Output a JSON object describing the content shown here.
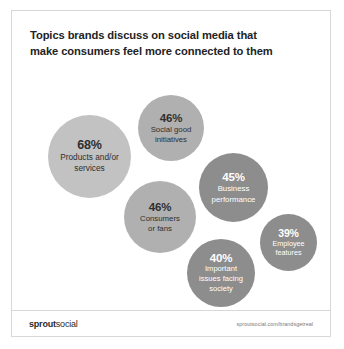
{
  "card": {
    "title_lines": [
      "Topics brands discuss on social media that",
      "make consumers feel more connected to them"
    ]
  },
  "footer": {
    "logo_strong": "sprout",
    "logo_light": "social",
    "url": "sproutsocial.com/brandsgetreal"
  },
  "colors": {
    "bubble_light": "#c2c2c2",
    "bubble_mid": "#b0b0b0",
    "bubble_dark": "#8d8d8d",
    "text_dark": "#2f2f2f",
    "text_light": "#ffffff",
    "title": "#232323",
    "border": "#d8d8d8"
  },
  "chart_data": {
    "type": "bubble",
    "title": "Topics brands discuss on social media that make consumers feel more connected to them",
    "xlabel": "",
    "ylabel": "",
    "value_unit": "percent",
    "legend": "none",
    "grid": false,
    "categories": [
      "Products and/or services",
      "Social good initiatives",
      "Business performance",
      "Consumers or fans",
      "Important issues facing society",
      "Employee features"
    ],
    "values": [
      68,
      46,
      45,
      46,
      40,
      39
    ],
    "bubbles": [
      {
        "id": "products",
        "percent": "68%",
        "label_lines": [
          "Products and/or",
          "services"
        ],
        "value": 68,
        "shade": "light"
      },
      {
        "id": "socialgood",
        "percent": "46%",
        "label_lines": [
          "Social good",
          "initiatives"
        ],
        "value": 46,
        "shade": "mid"
      },
      {
        "id": "business",
        "percent": "45%",
        "label_lines": [
          "Business",
          "performance"
        ],
        "value": 45,
        "shade": "dark"
      },
      {
        "id": "consumers",
        "percent": "46%",
        "label_lines": [
          "Consumers",
          "or fans"
        ],
        "value": 46,
        "shade": "mid"
      },
      {
        "id": "issues",
        "percent": "40%",
        "label_lines": [
          "Important",
          "issues facing",
          "society"
        ],
        "value": 40,
        "shade": "dark"
      },
      {
        "id": "employee",
        "percent": "39%",
        "label_lines": [
          "Employee",
          "features"
        ],
        "value": 39,
        "shade": "dark"
      }
    ]
  }
}
